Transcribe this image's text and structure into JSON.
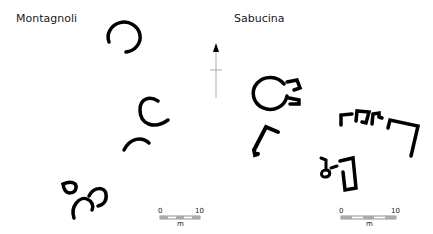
{
  "sites": [
    {
      "name": "Montagnoli",
      "scale": {
        "start": "0",
        "end": "10",
        "unit": "m"
      }
    },
    {
      "name": "Sabucina",
      "scale": {
        "start": "0",
        "end": "10",
        "unit": "m"
      }
    }
  ],
  "north_arrow": {
    "icon": "north-arrow-icon"
  },
  "colors": {
    "structure": "#000000",
    "text": "#1a1a1a",
    "scale_bar": "#888888"
  }
}
